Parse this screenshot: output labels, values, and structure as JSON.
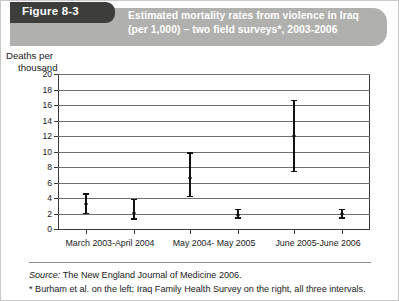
{
  "figure": {
    "tab_label": "Figure 8-3",
    "title_line1": "Estimated mortality rates from violence in Iraq",
    "title_line2": "(per 1,000) – two field surveys*, 2003-2006",
    "banner_color": "#b0b0ae",
    "tab_color": "#3d3d3c"
  },
  "axis_title_line1": "Deaths per",
  "axis_title_line2": "thousand",
  "footer": {
    "source_label": "Source:",
    "source_text": " The New England Journal of Medicine 2006.",
    "note": "* Burham et al. on the left; Iraq Family Health Survey on the right, all three intervals."
  },
  "chart_data": {
    "type": "scatter",
    "title": "Estimated mortality rates from violence in Iraq (per 1,000) – two field surveys*, 2003-2006",
    "xlabel": "",
    "ylabel": "Deaths per thousand",
    "ylim": [
      0,
      20
    ],
    "yticks": [
      0,
      2,
      4,
      6,
      8,
      10,
      12,
      14,
      16,
      18,
      20
    ],
    "ytick_labels": [
      "0",
      "2",
      "4",
      "6",
      "8",
      "10",
      "12",
      "14",
      "16",
      "18",
      "20"
    ],
    "grid": true,
    "legend": "none",
    "categories": [
      "March 2003-April 2004",
      "May 2004- May 2005",
      "June 2005-June 2006"
    ],
    "series": [
      {
        "name": "Burham et al. (left)",
        "values": [
          3.2,
          6.6,
          12.0
        ],
        "lower": [
          1.9,
          4.1,
          7.3
        ],
        "upper": [
          4.6,
          9.9,
          16.7
        ]
      },
      {
        "name": "Iraq Family Health Survey (right)",
        "values": [
          2.1,
          1.8,
          1.9
        ],
        "lower": [
          1.2,
          1.3,
          1.3
        ],
        "upper": [
          3.9,
          2.6,
          2.6
        ]
      }
    ],
    "annotations": [
      "Burham et al. on the left; Iraq Family Health Survey on the right, all three intervals."
    ]
  }
}
